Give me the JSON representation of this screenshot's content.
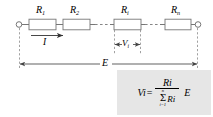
{
  "figure": {
    "colors": {
      "line": "#555555",
      "resistor_stroke": "#777777",
      "formula_box_bg": "#e6e6e6",
      "text": "#000000"
    }
  },
  "circuit": {
    "resistors": [
      {
        "id": "r1",
        "base": "R",
        "subscript": "1"
      },
      {
        "id": "r2",
        "base": "R",
        "subscript": "2"
      },
      {
        "id": "ri",
        "base": "R",
        "subscript": "i"
      },
      {
        "id": "rn",
        "base": "R",
        "subscript": "n"
      }
    ],
    "current": {
      "base": "I",
      "subscript": ""
    },
    "voltage_drop": {
      "base": "V",
      "subscript": "i"
    },
    "source_voltage": {
      "base": "E",
      "subscript": ""
    }
  },
  "formula": {
    "lhs_base": "V",
    "lhs_sub": "i",
    "equals": "=",
    "numerator_base": "R",
    "numerator_sub": "i",
    "sigma": "Σ",
    "sigma_upper": "n",
    "sigma_lower": "i=1",
    "denominator_base": "R",
    "denominator_sub": "i",
    "multiplier": "E"
  }
}
